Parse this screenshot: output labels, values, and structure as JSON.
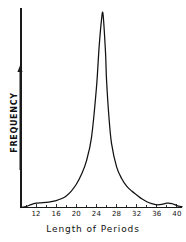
{
  "chart_data": {
    "type": "line",
    "title": "",
    "subtitle": "",
    "xlabel": "Length of Periods",
    "ylabel": "FREQUENCY",
    "xlim": [
      9,
      41
    ],
    "ylim": [
      0,
      100
    ],
    "grid": false,
    "legend": null,
    "x_ticks_labeled": [
      12,
      16,
      20,
      24,
      28,
      32,
      36,
      40
    ],
    "x_tick_labels": [
      "12",
      "16",
      "20",
      "24",
      "28",
      "32",
      "36",
      "40"
    ],
    "x_minor_ticks": [
      10,
      14,
      18,
      22,
      26,
      30,
      34,
      38
    ],
    "y_ticks_labeled": [],
    "y_tick_labels": [],
    "y_axis_arrow": true,
    "series": [
      {
        "name": "Frequency of period lengths",
        "x": [
          9,
          10,
          11,
          12,
          13,
          14,
          15,
          16,
          17,
          18,
          19,
          20,
          21,
          22,
          23,
          24,
          24.5,
          25,
          25.3,
          25.8,
          26,
          26.5,
          27,
          28,
          29,
          30,
          31,
          32,
          33,
          34,
          35,
          36,
          37,
          38,
          39,
          40,
          41
        ],
        "values": [
          0,
          0.5,
          1.5,
          2.2,
          2.4,
          2.6,
          3.0,
          3.6,
          4.5,
          6.0,
          8.5,
          12.0,
          17.0,
          24.0,
          36.0,
          62.0,
          82.0,
          97.0,
          100.0,
          80.0,
          66.0,
          46.0,
          33.0,
          21.0,
          15.0,
          11.0,
          8.5,
          6.5,
          4.5,
          3.0,
          2.0,
          1.4,
          1.6,
          2.2,
          2.0,
          1.0,
          0.4
        ]
      }
    ],
    "annotations": [
      {
        "text": "sharp leptokurtic peak",
        "x": 25.3,
        "y": 100
      },
      {
        "text": "minor secondary bump in left tail",
        "x": 13.5,
        "y": 2.5
      },
      {
        "text": "minor secondary bump in right tail",
        "x": 38,
        "y": 2.2
      }
    ],
    "colors": {
      "curve": "#111111",
      "axis": "#1a1a1a",
      "background": "#ffffff",
      "text": "#111111"
    }
  },
  "axes": {
    "x_axis_name": "x-axis",
    "y_axis_name": "y-axis"
  }
}
